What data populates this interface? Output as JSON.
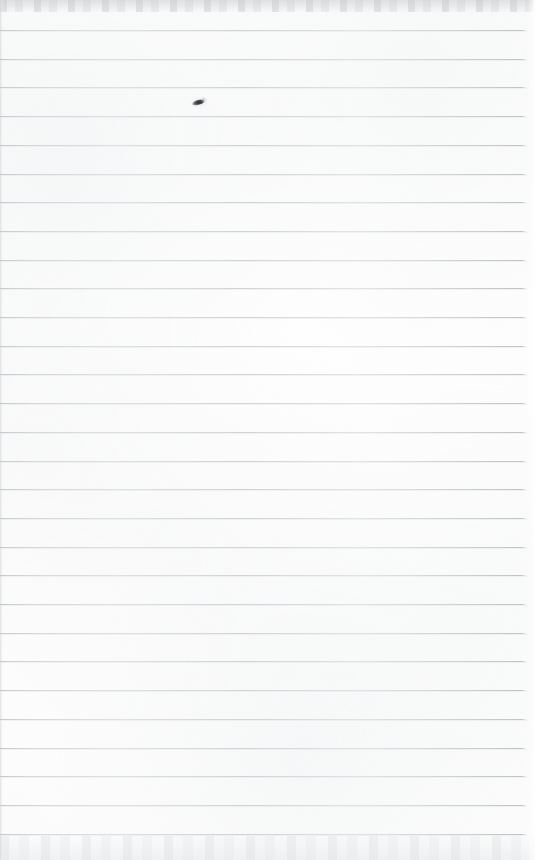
{
  "document": {
    "kind": "scanned-lined-notebook-page",
    "title": "Blank ruled notebook page",
    "width": 535,
    "height": 860,
    "text_content": "",
    "has_handwriting": false,
    "has_printed_text": false
  },
  "paper": {
    "background_color": "#fdfdfd",
    "tone_color": "#fafafa",
    "edge_band_color": "#cdcfd1",
    "left_edge_color": "#d6d8da",
    "description": "Near-white scanned sheet with faint grey mottling and scanner edge bands at the top and bottom."
  },
  "rules": {
    "label": "horizontal ruled lines",
    "color": "#c7cacd",
    "thickness_px": 1,
    "count": 29,
    "first_line_y": 30,
    "spacing_px": 28.7,
    "start_x": 0,
    "end_x": 527,
    "y_positions": [
      30,
      58.7,
      87.4,
      116.1,
      144.8,
      173.5,
      202.2,
      230.9,
      259.6,
      288.3,
      317.0,
      345.7,
      374.4,
      403.1,
      431.8,
      460.5,
      489.2,
      517.9,
      546.6,
      575.3,
      604.0,
      632.7,
      661.4,
      690.1,
      718.8,
      747.5,
      776.2,
      804.9,
      833.6
    ]
  },
  "marks": [
    {
      "name": "ink-speck",
      "label": "small dark ink speck",
      "x": 192,
      "y": 96,
      "width": 16,
      "height": 10,
      "color": "#2b2b2d"
    }
  ],
  "scan_edges": {
    "top_label": "top scanner edge band",
    "bottom_label": "bottom scanner edge band",
    "left_label": "left scanner edge shadow",
    "right_label": "right scanner edge highlight"
  }
}
